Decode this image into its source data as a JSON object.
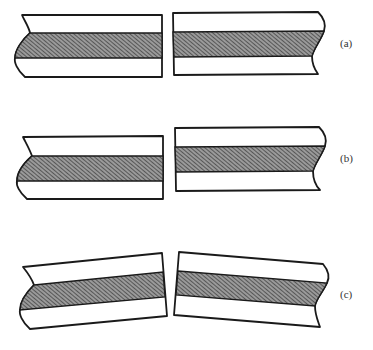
{
  "figure": {
    "hatch_color": "#555555",
    "line_color": "#1a1a1a",
    "panels": [
      {
        "id": "a",
        "label": "(a)",
        "description": "Two beam segments aligned, band continuous"
      },
      {
        "id": "b",
        "label": "(b)",
        "description": "Two beam segments vertically offset (shear)"
      },
      {
        "id": "c",
        "label": "(c)",
        "description": "Two beam segments rotated (bending)"
      }
    ]
  }
}
